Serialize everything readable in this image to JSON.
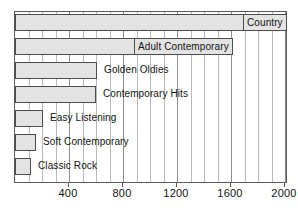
{
  "chart_data": {
    "type": "bar",
    "orientation": "horizontal",
    "title": "",
    "subtitle": "",
    "xlabel": "",
    "ylabel": "",
    "xlim": [
      0,
      2020
    ],
    "grid": true,
    "gridline_step": 100,
    "legend": "none",
    "categories": [
      "Country",
      "Adult Contemporary",
      "Golden Oldies",
      "Contemporary Hits",
      "Easy Listening",
      "Soft Contemporary",
      "Classic Rock"
    ],
    "values": [
      2010,
      1610,
      610,
      600,
      210,
      155,
      120
    ],
    "xticks": [
      400,
      800,
      1200,
      1600,
      2000
    ],
    "xticklabels": [
      "400",
      "800",
      "1200",
      "1600",
      "2000"
    ],
    "bars": [
      {
        "label": "Country",
        "value": 2010,
        "label_boxed": true,
        "label_inside": true
      },
      {
        "label": "Adult Contemporary",
        "value": 1610,
        "label_boxed": true,
        "label_inside": true
      },
      {
        "label": "Golden Oldies",
        "value": 610,
        "label_boxed": false,
        "label_inside": false
      },
      {
        "label": "Contemporary Hits",
        "value": 600,
        "label_boxed": false,
        "label_inside": false
      },
      {
        "label": "Easy Listening",
        "value": 210,
        "label_boxed": false,
        "label_inside": false
      },
      {
        "label": "Soft Contemporary",
        "value": 155,
        "label_boxed": false,
        "label_inside": false
      },
      {
        "label": "Classic Rock",
        "value": 120,
        "label_boxed": false,
        "label_inside": false
      }
    ],
    "colors": {
      "bar_fill": "#e3e3e3",
      "bar_stroke": "#4d4d4d",
      "gridline": "#b9b9b9",
      "gridline_major": "#8d8d8d",
      "axis": "#5a5a5a",
      "text": "#141414",
      "background": "#ffffff"
    }
  }
}
